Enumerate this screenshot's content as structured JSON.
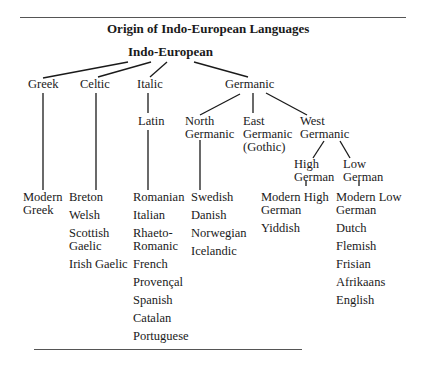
{
  "title": "Origin of Indo-European Languages",
  "root": "Indo-European",
  "branches": {
    "greek": "Greek",
    "celtic": "Celtic",
    "italic": "Italic",
    "latin": "Latin",
    "germanic": "Germanic",
    "north_germanic": [
      "North",
      "Germanic"
    ],
    "east_germanic": [
      "East",
      "Germanic",
      "(Gothic)"
    ],
    "west_germanic": [
      "West",
      "Germanic"
    ],
    "high_german": [
      "High",
      "German"
    ],
    "low_german": [
      "Low",
      "German"
    ]
  },
  "leaves": {
    "greek": [
      "Modern",
      "Greek"
    ],
    "celtic": [
      "Breton",
      "Welsh",
      "Scottish",
      "Gaelic",
      "Irish Gaelic"
    ],
    "latin": [
      "Romanian",
      "Italian",
      "Rhaeto-",
      "Romanic",
      "French",
      "Provençal",
      "Spanish",
      "Catalan",
      "Portuguese"
    ],
    "north_germanic": [
      "Swedish",
      "Danish",
      "Norwegian",
      "Icelandic"
    ],
    "high_german": [
      "Modern High",
      "German",
      "Yiddish"
    ],
    "low_german": [
      "Modern Low",
      "German",
      "Dutch",
      "Flemish",
      "Frisian",
      "Afrikaans",
      "English"
    ]
  }
}
